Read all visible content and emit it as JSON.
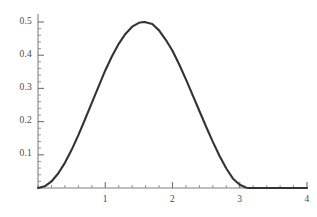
{
  "chart_data": {
    "type": "line",
    "title": "",
    "subtitle": "",
    "xlabel": "",
    "ylabel": "",
    "xlim": [
      -0.02,
      4.02
    ],
    "ylim": [
      0,
      0.53
    ],
    "grid": false,
    "legend": null,
    "annotations": [],
    "x_ticks_major": [
      1,
      2,
      3,
      4
    ],
    "x_tick_labels": [
      "1",
      "2",
      "3",
      "4"
    ],
    "x_ticks_minor_step": 0.2,
    "y_ticks_major": [
      0.1,
      0.2,
      0.3,
      0.4,
      0.5
    ],
    "y_tick_labels": [
      "0.1",
      "0.2",
      "0.3",
      "0.4",
      "0.5"
    ],
    "y_ticks_minor_step": 0.02,
    "series": [
      {
        "name": "curve",
        "color": "#333333",
        "linewidth": 2.1,
        "description": "half-sine-squared bump peaking at 0.5 near x = 1.571, zero for x >= 3.142",
        "x": [
          0,
          0.1,
          0.2,
          0.3,
          0.4,
          0.5,
          0.6,
          0.7,
          0.8,
          0.9,
          1,
          1.1,
          1.2,
          1.3,
          1.4,
          1.5,
          1.5708,
          1.6,
          1.7,
          1.8,
          1.9,
          2,
          2.1,
          2.2,
          2.3,
          2.4,
          2.5,
          2.6,
          2.7,
          2.8,
          2.9,
          3,
          3.1,
          3.1416,
          3.2,
          3.4,
          3.6,
          3.8,
          4
        ],
        "y": [
          0,
          0.00499,
          0.01974,
          0.04363,
          0.07584,
          0.1149,
          0.15924,
          0.20699,
          0.25629,
          0.30526,
          0.35404,
          0.39695,
          0.4343,
          0.46409,
          0.4858,
          0.4975,
          0.5,
          0.4995,
          0.49383,
          0.47479,
          0.44637,
          0.41319,
          0.37186,
          0.327,
          0.27991,
          0.23194,
          0.18451,
          0.13894,
          0.09657,
          0.05865,
          0.028,
          0.00996,
          0.00087,
          0,
          0,
          0,
          0,
          0,
          0
        ]
      }
    ],
    "axes": {
      "axis_color": "#777777",
      "tick_color": "#777777",
      "label_color": "#4a4a4a",
      "background": "#ffffff"
    }
  }
}
